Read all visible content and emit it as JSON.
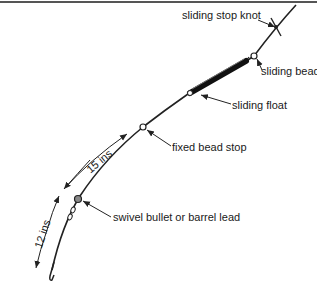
{
  "diagram": {
    "type": "fishing rig illustration",
    "labels": {
      "sliding_stop_knot": "sliding stop knot",
      "sliding_bead": "sliding bead",
      "sliding_float": "sliding float",
      "fixed_bead_stop": "fixed bead stop",
      "swivel_lead": "swivel bullet or barrel lead"
    },
    "dimensions": {
      "upper": "15 ins",
      "lower": "12 ins"
    },
    "colors": {
      "line": "#222222",
      "text": "#1a1a1a",
      "rule": "#555555",
      "background": "#ffffff"
    }
  }
}
